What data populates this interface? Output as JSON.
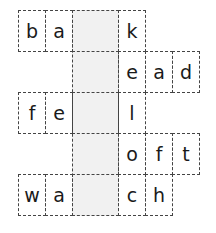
{
  "puzzle": {
    "type": "missing-middle-letters word puzzle",
    "shaded_column_color": "#f1f1f1",
    "rows": [
      {
        "id": "row-1",
        "left": [
          "b",
          "a"
        ],
        "right": [
          "k"
        ],
        "word_pattern": "ba_k"
      },
      {
        "id": "row-2",
        "left": [],
        "right": [
          "e",
          "a",
          "d"
        ],
        "word_pattern": "_ead"
      },
      {
        "id": "row-3",
        "left": [
          "f",
          "e"
        ],
        "right": [
          "l"
        ],
        "word_pattern": "fe_l"
      },
      {
        "id": "row-4",
        "left": [],
        "right": [
          "o",
          "f",
          "t"
        ],
        "word_pattern": "_oft"
      },
      {
        "id": "row-5",
        "left": [
          "w",
          "a"
        ],
        "right": [
          "c",
          "h"
        ],
        "word_pattern": "wa_ch"
      }
    ]
  }
}
